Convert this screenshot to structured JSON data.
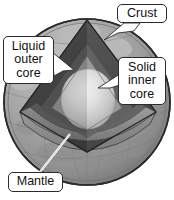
{
  "diagram": {
    "background_color": "#ffffff",
    "colors": {
      "surface_light": "#b4b4b4",
      "surface_mid": "#9c9c9c",
      "surface_dark": "#868686",
      "crust_edge": "#6e6e6e",
      "outer_core_dark": "#4a4a4a",
      "outer_core_darker": "#3c3c3c",
      "mantle_band": "#8c8c8c",
      "mantle_band_light": "#a0a0a0",
      "inner_core_light": "#e6e6e6",
      "inner_core_mid": "#cfcfcf",
      "outline": "#2b2b2b",
      "leader_line": "#ffffff",
      "label_text": "#111111",
      "label_fill": "#ffffff"
    },
    "labels": [
      {
        "id": "crust",
        "text": "Crust",
        "pointer": "arrow-down-left",
        "points_to": "outer surface shell at top of globe"
      },
      {
        "id": "liquid_outer_core",
        "text": "Liquid\nouter\ncore",
        "pointer": "arrow-right-down",
        "points_to": "dark wedge layer surrounding inner core"
      },
      {
        "id": "solid_inner_core",
        "text": "Solid\ninner\ncore",
        "pointer": "arrow-left",
        "points_to": "bright sphere at center"
      },
      {
        "id": "mantle",
        "text": "Mantle",
        "pointer": "leader-line-up-right",
        "points_to": "mid-gray band between crust and outer core"
      }
    ],
    "layers": [
      {
        "name": "Crust",
        "tone": "light-gray textured with continents"
      },
      {
        "name": "Mantle",
        "tone": "mid-gray band"
      },
      {
        "name": "Liquid outer core",
        "tone": "dark-gray wedge"
      },
      {
        "name": "Solid inner core",
        "tone": "light highlighted sphere"
      }
    ]
  }
}
